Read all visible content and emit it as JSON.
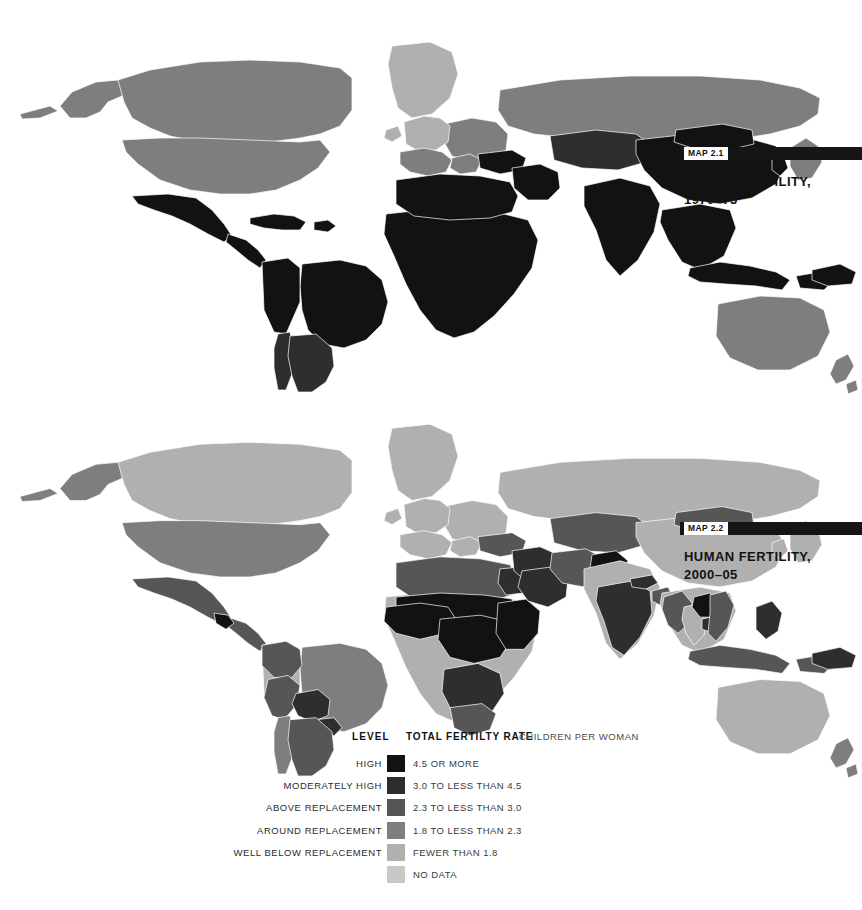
{
  "page": {
    "background": "#ffffff",
    "title": "Human Fertility"
  },
  "maps": [
    {
      "map_number": "MAP 2.1",
      "heading": "HUMAN FERTILITY,\n1970–75",
      "period": "1970–75"
    },
    {
      "map_number": "MAP 2.2",
      "heading": "HUMAN FERTILITY,\n2000–05",
      "period": "2000–05"
    }
  ],
  "legend": {
    "header": {
      "level_label": "LEVEL",
      "rate_label": "TOTAL FERTILTY RATE",
      "units_label": "CHILDREN PER WOMAN"
    },
    "rows": [
      {
        "level": "HIGH",
        "value": "4.5 OR MORE",
        "color": "#121212"
      },
      {
        "level": "MODERATELY HIGH",
        "value": "3.0 TO LESS THAN 4.5",
        "color": "#2e2e2e"
      },
      {
        "level": "ABOVE REPLACEMENT",
        "value": "2.3 TO LESS THAN 3.0",
        "color": "#565656"
      },
      {
        "level": "AROUND REPLACEMENT",
        "value": "1.8 TO LESS THAN 2.3",
        "color": "#7e7e7e"
      },
      {
        "level": "WELL BELOW REPLACEMENT",
        "value": "FEWER THAN 1.8",
        "color": "#b0b0b0"
      },
      {
        "level": "",
        "value": "NO DATA",
        "color": "#c8c8c8"
      }
    ]
  },
  "chart_data": {
    "type": "map",
    "title": "Human Fertility",
    "subtitle": "Total fertility rate, children per woman",
    "projection": "world-equirectangular-simplified",
    "classes": [
      {
        "name": "HIGH",
        "range": "4.5 OR MORE",
        "color": "#121212"
      },
      {
        "name": "MODERATELY HIGH",
        "range": "3.0 TO LESS THAN 4.5",
        "color": "#2e2e2e"
      },
      {
        "name": "ABOVE REPLACEMENT",
        "range": "2.3 TO LESS THAN 3.0",
        "color": "#565656"
      },
      {
        "name": "AROUND REPLACEMENT",
        "range": "1.8 TO LESS THAN 2.3",
        "color": "#7e7e7e"
      },
      {
        "name": "WELL BELOW REPLACEMENT",
        "range": "FEWER THAN 1.8",
        "color": "#b0b0b0"
      },
      {
        "name": "NO DATA",
        "range": "NO DATA",
        "color": "#c8c8c8"
      }
    ],
    "panels": [
      {
        "map_number": "MAP 2.1",
        "period": "1970-75",
        "regions": [
          {
            "name": "Canada",
            "class": "AROUND REPLACEMENT",
            "color": "#7e7e7e"
          },
          {
            "name": "United States",
            "class": "AROUND REPLACEMENT",
            "color": "#7e7e7e"
          },
          {
            "name": "Alaska",
            "class": "AROUND REPLACEMENT",
            "color": "#7e7e7e"
          },
          {
            "name": "Greenland",
            "class": "WELL BELOW REPLACEMENT",
            "color": "#b0b0b0"
          },
          {
            "name": "Mexico",
            "class": "HIGH",
            "color": "#121212"
          },
          {
            "name": "Central America",
            "class": "HIGH",
            "color": "#121212"
          },
          {
            "name": "Caribbean",
            "class": "HIGH",
            "color": "#121212"
          },
          {
            "name": "Brazil",
            "class": "HIGH",
            "color": "#121212"
          },
          {
            "name": "Andean South America",
            "class": "HIGH",
            "color": "#121212"
          },
          {
            "name": "Argentina",
            "class": "MODERATELY HIGH",
            "color": "#2e2e2e"
          },
          {
            "name": "Chile",
            "class": "MODERATELY HIGH",
            "color": "#2e2e2e"
          },
          {
            "name": "Western Europe",
            "class": "WELL BELOW REPLACEMENT",
            "color": "#b0b0b0"
          },
          {
            "name": "Southern Europe",
            "class": "AROUND REPLACEMENT",
            "color": "#7e7e7e"
          },
          {
            "name": "Eastern Europe",
            "class": "AROUND REPLACEMENT",
            "color": "#7e7e7e"
          },
          {
            "name": "Russia",
            "class": "AROUND REPLACEMENT",
            "color": "#7e7e7e"
          },
          {
            "name": "North Africa",
            "class": "HIGH",
            "color": "#121212"
          },
          {
            "name": "Sub-Saharan Africa",
            "class": "HIGH",
            "color": "#121212"
          },
          {
            "name": "Middle East",
            "class": "HIGH",
            "color": "#121212"
          },
          {
            "name": "Turkey",
            "class": "HIGH",
            "color": "#121212"
          },
          {
            "name": "Central Asia",
            "class": "MODERATELY HIGH",
            "color": "#2e2e2e"
          },
          {
            "name": "South Asia",
            "class": "HIGH",
            "color": "#121212"
          },
          {
            "name": "China",
            "class": "HIGH",
            "color": "#121212"
          },
          {
            "name": "Mongolia",
            "class": "HIGH",
            "color": "#121212"
          },
          {
            "name": "Southeast Asia",
            "class": "HIGH",
            "color": "#121212"
          },
          {
            "name": "Indonesia",
            "class": "HIGH",
            "color": "#121212"
          },
          {
            "name": "Japan",
            "class": "AROUND REPLACEMENT",
            "color": "#7e7e7e"
          },
          {
            "name": "Korea",
            "class": "HIGH",
            "color": "#121212"
          },
          {
            "name": "Papua New Guinea",
            "class": "HIGH",
            "color": "#121212"
          },
          {
            "name": "Australia",
            "class": "AROUND REPLACEMENT",
            "color": "#7e7e7e"
          },
          {
            "name": "New Zealand",
            "class": "AROUND REPLACEMENT",
            "color": "#7e7e7e"
          }
        ]
      },
      {
        "map_number": "MAP 2.2",
        "period": "2000-05",
        "regions": [
          {
            "name": "Canada",
            "class": "WELL BELOW REPLACEMENT",
            "color": "#b0b0b0"
          },
          {
            "name": "United States",
            "class": "AROUND REPLACEMENT",
            "color": "#7e7e7e"
          },
          {
            "name": "Alaska",
            "class": "AROUND REPLACEMENT",
            "color": "#7e7e7e"
          },
          {
            "name": "Greenland",
            "class": "WELL BELOW REPLACEMENT",
            "color": "#b0b0b0"
          },
          {
            "name": "Mexico",
            "class": "ABOVE REPLACEMENT",
            "color": "#565656"
          },
          {
            "name": "Guatemala",
            "class": "HIGH",
            "color": "#121212"
          },
          {
            "name": "Central America",
            "class": "ABOVE REPLACEMENT",
            "color": "#565656"
          },
          {
            "name": "Brazil",
            "class": "AROUND REPLACEMENT",
            "color": "#7e7e7e"
          },
          {
            "name": "Colombia",
            "class": "ABOVE REPLACEMENT",
            "color": "#565656"
          },
          {
            "name": "Peru",
            "class": "ABOVE REPLACEMENT",
            "color": "#565656"
          },
          {
            "name": "Bolivia",
            "class": "MODERATELY HIGH",
            "color": "#2e2e2e"
          },
          {
            "name": "Paraguay",
            "class": "MODERATELY HIGH",
            "color": "#2e2e2e"
          },
          {
            "name": "Argentina",
            "class": "ABOVE REPLACEMENT",
            "color": "#565656"
          },
          {
            "name": "Chile",
            "class": "AROUND REPLACEMENT",
            "color": "#7e7e7e"
          },
          {
            "name": "Western Europe",
            "class": "WELL BELOW REPLACEMENT",
            "color": "#b0b0b0"
          },
          {
            "name": "Southern Europe",
            "class": "WELL BELOW REPLACEMENT",
            "color": "#b0b0b0"
          },
          {
            "name": "Eastern Europe",
            "class": "WELL BELOW REPLACEMENT",
            "color": "#b0b0b0"
          },
          {
            "name": "Russia",
            "class": "WELL BELOW REPLACEMENT",
            "color": "#b0b0b0"
          },
          {
            "name": "North Africa",
            "class": "ABOVE REPLACEMENT",
            "color": "#565656"
          },
          {
            "name": "Egypt",
            "class": "MODERATELY HIGH",
            "color": "#2e2e2e"
          },
          {
            "name": "Sahel",
            "class": "HIGH",
            "color": "#121212"
          },
          {
            "name": "West Africa",
            "class": "HIGH",
            "color": "#121212"
          },
          {
            "name": "Central Africa",
            "class": "HIGH",
            "color": "#121212"
          },
          {
            "name": "East Africa",
            "class": "HIGH",
            "color": "#121212"
          },
          {
            "name": "Southern Africa",
            "class": "MODERATELY HIGH",
            "color": "#2e2e2e"
          },
          {
            "name": "South Africa",
            "class": "ABOVE REPLACEMENT",
            "color": "#565656"
          },
          {
            "name": "Middle East",
            "class": "MODERATELY HIGH",
            "color": "#2e2e2e"
          },
          {
            "name": "Saudi Arabia",
            "class": "MODERATELY HIGH",
            "color": "#2e2e2e"
          },
          {
            "name": "Turkey",
            "class": "ABOVE REPLACEMENT",
            "color": "#565656"
          },
          {
            "name": "Iran",
            "class": "ABOVE REPLACEMENT",
            "color": "#565656"
          },
          {
            "name": "Central Asia",
            "class": "ABOVE REPLACEMENT",
            "color": "#565656"
          },
          {
            "name": "Afghanistan",
            "class": "HIGH",
            "color": "#121212"
          },
          {
            "name": "Pakistan",
            "class": "HIGH",
            "color": "#121212"
          },
          {
            "name": "India",
            "class": "MODERATELY HIGH",
            "color": "#2e2e2e"
          },
          {
            "name": "Nepal",
            "class": "MODERATELY HIGH",
            "color": "#2e2e2e"
          },
          {
            "name": "Bangladesh",
            "class": "ABOVE REPLACEMENT",
            "color": "#565656"
          },
          {
            "name": "China",
            "class": "WELL BELOW REPLACEMENT",
            "color": "#b0b0b0"
          },
          {
            "name": "Mongolia",
            "class": "ABOVE REPLACEMENT",
            "color": "#565656"
          },
          {
            "name": "Myanmar",
            "class": "ABOVE REPLACEMENT",
            "color": "#565656"
          },
          {
            "name": "Laos",
            "class": "HIGH",
            "color": "#121212"
          },
          {
            "name": "Cambodia",
            "class": "MODERATELY HIGH",
            "color": "#2e2e2e"
          },
          {
            "name": "Thailand",
            "class": "WELL BELOW REPLACEMENT",
            "color": "#b0b0b0"
          },
          {
            "name": "Vietnam",
            "class": "ABOVE REPLACEMENT",
            "color": "#565656"
          },
          {
            "name": "Indonesia",
            "class": "ABOVE REPLACEMENT",
            "color": "#565656"
          },
          {
            "name": "Philippines",
            "class": "MODERATELY HIGH",
            "color": "#2e2e2e"
          },
          {
            "name": "Japan",
            "class": "WELL BELOW REPLACEMENT",
            "color": "#b0b0b0"
          },
          {
            "name": "Korea",
            "class": "WELL BELOW REPLACEMENT",
            "color": "#b0b0b0"
          },
          {
            "name": "Papua New Guinea",
            "class": "MODERATELY HIGH",
            "color": "#2e2e2e"
          },
          {
            "name": "Australia",
            "class": "WELL BELOW REPLACEMENT",
            "color": "#b0b0b0"
          },
          {
            "name": "New Zealand",
            "class": "AROUND REPLACEMENT",
            "color": "#7e7e7e"
          }
        ]
      }
    ]
  }
}
